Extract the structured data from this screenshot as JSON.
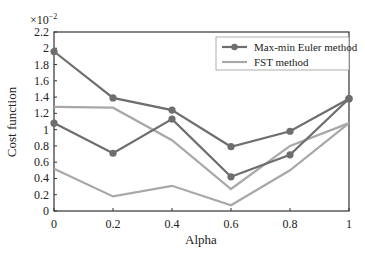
{
  "chart_data": {
    "type": "line",
    "title": "",
    "xlabel": "Alpha",
    "ylabel": "Cost function",
    "y_multiplier": "×10",
    "y_multiplier_exp": "−2",
    "x": [
      0,
      0.2,
      0.4,
      0.6,
      0.8,
      1
    ],
    "x_tick_labels": [
      "0",
      "0.2",
      "0.4",
      "0.6",
      "0.8",
      "1"
    ],
    "y_tick_labels": [
      "0",
      "0.2",
      "0.4",
      "0.6",
      "0.8",
      "1",
      "1.2",
      "1.4",
      "1.6",
      "1.8",
      "2",
      "2.2"
    ],
    "ylim": [
      0,
      2.2
    ],
    "xlim": [
      0,
      1
    ],
    "grid": false,
    "legend_position": "upper right",
    "series": [
      {
        "name": "Max-min Euler method",
        "marker": "circle",
        "color": "#6e6e6e",
        "values": [
          1.96,
          1.39,
          1.24,
          0.79,
          0.98,
          1.38
        ]
      },
      {
        "name": "Max-min Euler method",
        "marker": "circle",
        "color": "#6e6e6e",
        "values": [
          1.08,
          0.71,
          1.13,
          0.42,
          0.69,
          1.38
        ]
      },
      {
        "name": "FST method",
        "marker": "none",
        "color": "#a8a8a8",
        "values": [
          1.28,
          1.27,
          0.87,
          0.27,
          0.8,
          1.08
        ]
      },
      {
        "name": "FST method",
        "marker": "none",
        "color": "#a8a8a8",
        "values": [
          0.52,
          0.18,
          0.31,
          0.07,
          0.5,
          1.08
        ]
      }
    ],
    "legend": [
      {
        "label": "Max-min Euler method",
        "color": "#6e6e6e",
        "marker": "circle"
      },
      {
        "label": "FST method",
        "color": "#a8a8a8",
        "marker": "none"
      }
    ]
  }
}
